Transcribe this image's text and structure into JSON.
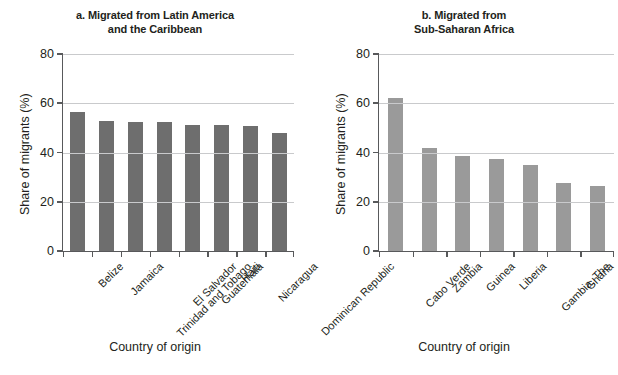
{
  "figure": {
    "background": "#ffffff",
    "axis_color": "#58595b",
    "grid_color": "#c9cacc"
  },
  "chart_data": [
    {
      "type": "bar",
      "panel": "a",
      "title": "a. Migrated from Latin America",
      "title_line2": "and the Caribbean",
      "title_full": "a. Migrated from Latin America and the Caribbean",
      "categories": [
        "Belize",
        "Jamaica",
        "Trinidad and Tobago",
        "El Salvador",
        "Guatemala",
        "Haiti",
        "Nicaragua",
        "Dominican Republic"
      ],
      "values": [
        56.5,
        53,
        52.5,
        52.3,
        51.3,
        51,
        50.8,
        48
      ],
      "xlabel": "Country of origin",
      "ylabel": "Share of migrants (%)",
      "ylim": [
        0,
        80
      ],
      "yticks": [
        0,
        20,
        40,
        60,
        80
      ],
      "ytick_labels": [
        "0",
        "20",
        "40",
        "60",
        "80"
      ],
      "grid": true,
      "legend": "none",
      "bar_color": "#6e6e6e"
    },
    {
      "type": "bar",
      "panel": "b",
      "title": "b. Migrated from",
      "title_line2": "Sub-Saharan Africa",
      "title_full": "b. Migrated from Sub-Saharan Africa",
      "categories": [
        "Cabo Verde",
        "Zambia",
        "Guinea",
        "Liberia",
        "Gambia, The",
        "Ghana",
        "Senegal"
      ],
      "values": [
        62,
        42,
        38.7,
        37.3,
        35,
        27.6,
        26.4
      ],
      "xlabel": "Country of origin",
      "ylabel": "Share of migrants (%)",
      "ylim": [
        0,
        80
      ],
      "yticks": [
        0,
        20,
        40,
        60,
        80
      ],
      "ytick_labels": [
        "0",
        "20",
        "40",
        "60",
        "80"
      ],
      "grid": true,
      "legend": "none",
      "bar_color": "#9a9a9a"
    }
  ]
}
